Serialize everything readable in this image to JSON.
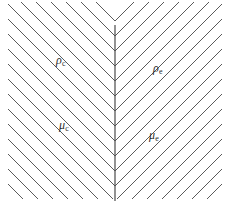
{
  "figure": {
    "width": 230,
    "height": 211,
    "background_color": "#ffffff",
    "line_color": "#5a5a5a",
    "line_width": 1,
    "center_line": {
      "name": "center-vertical-line",
      "x": 115,
      "y_top": 25,
      "y_bottom": 201,
      "color": "#4a4a4a",
      "width": 1.2
    },
    "hatching": {
      "left_region": {
        "name": "left-hatch-region",
        "direction": "down-right",
        "angle_degrees": 45,
        "line_count": 19,
        "spacing": 15
      },
      "right_region": {
        "name": "right-hatch-region",
        "direction": "up-right",
        "angle_degrees": -45,
        "line_count": 19,
        "spacing": 15
      }
    }
  },
  "labels": {
    "rho_c": {
      "symbol": "ρ",
      "subscript": "c",
      "x": 56,
      "y": 54
    },
    "rho_e": {
      "symbol": "ρ",
      "subscript": "e",
      "x": 153,
      "y": 62
    },
    "mu_c": {
      "symbol": "μ",
      "subscript": "c",
      "x": 59,
      "y": 119
    },
    "mu_e": {
      "symbol": "μ",
      "subscript": "e",
      "x": 149,
      "y": 129
    }
  },
  "chart_data": {
    "type": "diagram",
    "title": "",
    "xlabel": "",
    "ylabel": "",
    "annotations": [
      {
        "text": "ρc",
        "x": 56,
        "y": 54,
        "region": "upper-left"
      },
      {
        "text": "ρe",
        "x": 153,
        "y": 62,
        "region": "upper-right"
      },
      {
        "text": "μc",
        "x": 59,
        "y": 119,
        "region": "lower-left"
      },
      {
        "text": "μe",
        "x": 149,
        "y": 129,
        "region": "lower-right"
      }
    ],
    "left_hatch_lines": [
      {
        "x1": 96,
        "y1": 2,
        "x2": 115,
        "y2": 21
      },
      {
        "x1": 81,
        "y1": 2,
        "x2": 115,
        "y2": 36
      },
      {
        "x1": 66,
        "y1": 2,
        "x2": 115,
        "y2": 51
      },
      {
        "x1": 51,
        "y1": 2,
        "x2": 115,
        "y2": 66
      },
      {
        "x1": 36,
        "y1": 2,
        "x2": 115,
        "y2": 81
      },
      {
        "x1": 21,
        "y1": 2,
        "x2": 115,
        "y2": 96
      },
      {
        "x1": 8,
        "y1": 4,
        "x2": 115,
        "y2": 111
      },
      {
        "x1": 8,
        "y1": 19,
        "x2": 115,
        "y2": 126
      },
      {
        "x1": 8,
        "y1": 34,
        "x2": 115,
        "y2": 141
      },
      {
        "x1": 8,
        "y1": 49,
        "x2": 115,
        "y2": 156
      },
      {
        "x1": 8,
        "y1": 64,
        "x2": 115,
        "y2": 171
      },
      {
        "x1": 8,
        "y1": 79,
        "x2": 115,
        "y2": 186
      },
      {
        "x1": 8,
        "y1": 94,
        "x2": 113,
        "y2": 199
      },
      {
        "x1": 8,
        "y1": 109,
        "x2": 98,
        "y2": 199
      },
      {
        "x1": 8,
        "y1": 124,
        "x2": 83,
        "y2": 199
      },
      {
        "x1": 8,
        "y1": 139,
        "x2": 68,
        "y2": 199
      },
      {
        "x1": 8,
        "y1": 154,
        "x2": 53,
        "y2": 199
      },
      {
        "x1": 8,
        "y1": 169,
        "x2": 38,
        "y2": 199
      },
      {
        "x1": 8,
        "y1": 184,
        "x2": 23,
        "y2": 199
      }
    ],
    "right_hatch_lines": [
      {
        "x1": 115,
        "y1": 21,
        "x2": 134,
        "y2": 2
      },
      {
        "x1": 115,
        "y1": 36,
        "x2": 149,
        "y2": 2
      },
      {
        "x1": 115,
        "y1": 51,
        "x2": 164,
        "y2": 2
      },
      {
        "x1": 115,
        "y1": 66,
        "x2": 179,
        "y2": 2
      },
      {
        "x1": 115,
        "y1": 81,
        "x2": 194,
        "y2": 2
      },
      {
        "x1": 115,
        "y1": 96,
        "x2": 209,
        "y2": 2
      },
      {
        "x1": 115,
        "y1": 111,
        "x2": 222,
        "y2": 4
      },
      {
        "x1": 115,
        "y1": 126,
        "x2": 222,
        "y2": 19
      },
      {
        "x1": 115,
        "y1": 141,
        "x2": 222,
        "y2": 34
      },
      {
        "x1": 115,
        "y1": 156,
        "x2": 222,
        "y2": 49
      },
      {
        "x1": 115,
        "y1": 171,
        "x2": 222,
        "y2": 64
      },
      {
        "x1": 115,
        "y1": 186,
        "x2": 222,
        "y2": 79
      },
      {
        "x1": 117,
        "y1": 199,
        "x2": 222,
        "y2": 94
      },
      {
        "x1": 132,
        "y1": 199,
        "x2": 222,
        "y2": 109
      },
      {
        "x1": 147,
        "y1": 199,
        "x2": 222,
        "y2": 124
      },
      {
        "x1": 162,
        "y1": 199,
        "x2": 222,
        "y2": 139
      },
      {
        "x1": 177,
        "y1": 199,
        "x2": 222,
        "y2": 154
      },
      {
        "x1": 192,
        "y1": 199,
        "x2": 222,
        "y2": 169
      },
      {
        "x1": 207,
        "y1": 199,
        "x2": 222,
        "y2": 184
      }
    ]
  }
}
